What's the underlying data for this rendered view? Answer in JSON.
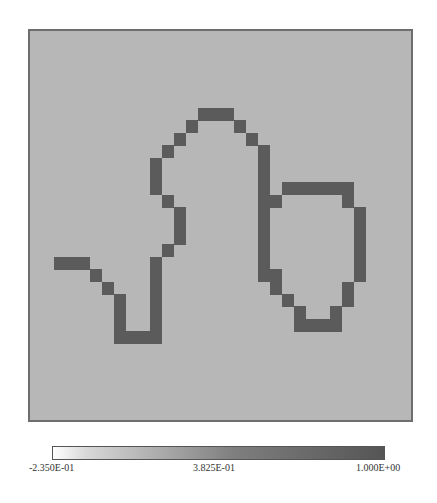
{
  "chart_data": {
    "type": "heatmap",
    "title": "",
    "xlabel": "",
    "ylabel": "",
    "grid_size": {
      "rows": 32,
      "cols": 33
    },
    "background_value": 0.3825,
    "curve_value": 1.0,
    "colormap": "grayscale (white to dark gray)",
    "colors": {
      "background": "#b7b7b7",
      "curve": "#5b5b5b",
      "frame": "#6e6e6e",
      "colorbar_low": "#ffffff",
      "colorbar_high": "#555555"
    },
    "curve_cells": [
      [
        18,
        2
      ],
      [
        18,
        3
      ],
      [
        18,
        4
      ],
      [
        19,
        5
      ],
      [
        20,
        6
      ],
      [
        21,
        7
      ],
      [
        22,
        7
      ],
      [
        23,
        7
      ],
      [
        24,
        7
      ],
      [
        24,
        8
      ],
      [
        24,
        9
      ],
      [
        24,
        10
      ],
      [
        23,
        10
      ],
      [
        22,
        10
      ],
      [
        21,
        10
      ],
      [
        20,
        10
      ],
      [
        19,
        10
      ],
      [
        18,
        10
      ],
      [
        17,
        11
      ],
      [
        16,
        12
      ],
      [
        15,
        12
      ],
      [
        14,
        12
      ],
      [
        13,
        11
      ],
      [
        12,
        10
      ],
      [
        11,
        10
      ],
      [
        10,
        10
      ],
      [
        9,
        11
      ],
      [
        8,
        12
      ],
      [
        7,
        13
      ],
      [
        6,
        14
      ],
      [
        6,
        15
      ],
      [
        6,
        16
      ],
      [
        7,
        17
      ],
      [
        8,
        18
      ],
      [
        9,
        19
      ],
      [
        10,
        19
      ],
      [
        11,
        19
      ],
      [
        12,
        19
      ],
      [
        13,
        19
      ],
      [
        14,
        19
      ],
      [
        15,
        19
      ],
      [
        16,
        19
      ],
      [
        17,
        19
      ],
      [
        18,
        19
      ],
      [
        19,
        19
      ],
      [
        13,
        20
      ],
      [
        12,
        21
      ],
      [
        12,
        22
      ],
      [
        12,
        23
      ],
      [
        12,
        24
      ],
      [
        12,
        25
      ],
      [
        12,
        26
      ],
      [
        13,
        26
      ],
      [
        14,
        27
      ],
      [
        15,
        27
      ],
      [
        16,
        27
      ],
      [
        17,
        27
      ],
      [
        18,
        27
      ],
      [
        19,
        27
      ],
      [
        20,
        26
      ],
      [
        21,
        26
      ],
      [
        22,
        25
      ],
      [
        23,
        25
      ],
      [
        23,
        24
      ],
      [
        23,
        23
      ],
      [
        23,
        22
      ],
      [
        22,
        22
      ],
      [
        21,
        21
      ],
      [
        20,
        20
      ],
      [
        19,
        20
      ]
    ],
    "colorbar": {
      "orientation": "horizontal",
      "placement": "bottom",
      "min": -0.235,
      "mid": 0.3825,
      "max": 1.0,
      "tick_labels": [
        "-2.350E-01",
        "3.825E-01",
        "1.000E+00"
      ]
    }
  }
}
